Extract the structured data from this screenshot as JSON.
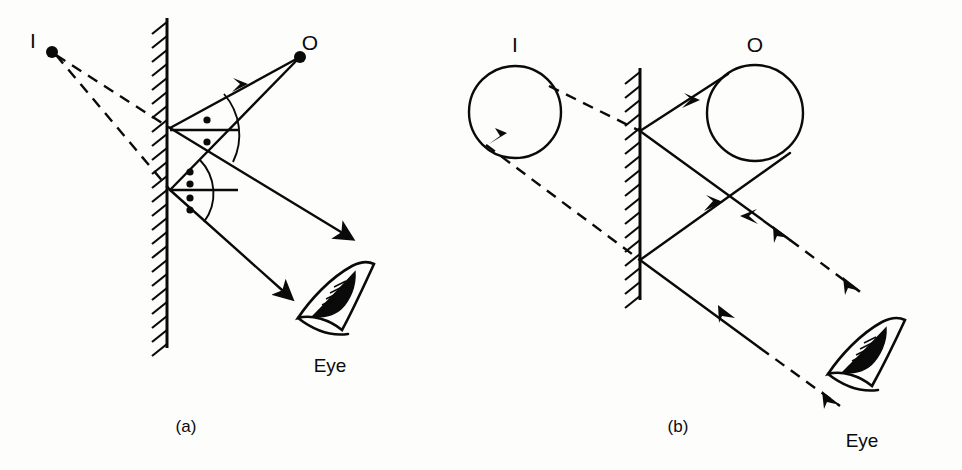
{
  "figure": {
    "background_color": "#fdfdfc",
    "ink_color": "#0a0a0a",
    "width": 962,
    "height": 470
  },
  "panel_a": {
    "caption": "(a)",
    "image_label": "I",
    "object_label": "O",
    "eye_label": "Eye",
    "description": "Point object O in front of a plane mirror; two rays reflect to the eye and the dashed backward extensions meet at the virtual image point I.",
    "mirror_x": 167,
    "mirror_top": 18,
    "mirror_bottom": 348,
    "object_point": [
      300,
      57
    ],
    "image_point": [
      52,
      52
    ],
    "reflection_points": [
      [
        170,
        128
      ],
      [
        170,
        190
      ]
    ],
    "angle_dots_upper": 1,
    "angle_dots_lower": 2,
    "label_positions": {
      "image": [
        33,
        48
      ],
      "object": [
        306,
        50
      ],
      "eye": [
        330,
        372
      ],
      "caption": [
        176,
        432
      ]
    }
  },
  "panel_b": {
    "caption": "(b)",
    "image_label": "I",
    "object_label": "O",
    "eye_label": "Eye",
    "description": "Extended circular object O in front of a plane mirror; reflected rays cross and the dashed extensions outline the virtual image circle I behind the mirror.",
    "mirror_x": 640,
    "mirror_top": 68,
    "mirror_bottom": 300,
    "object_circle": {
      "cx": 755,
      "cy": 113,
      "r": 48
    },
    "image_circle": {
      "cx": 515,
      "cy": 112,
      "r": 46
    },
    "reflection_points": [
      [
        640,
        131
      ],
      [
        640,
        260
      ]
    ],
    "label_positions": {
      "image": [
        511,
        48
      ],
      "object": [
        748,
        48
      ],
      "eye": [
        860,
        447
      ],
      "caption": [
        668,
        432
      ]
    }
  },
  "legend": {
    "solid_ray": "actual light ray",
    "dashed_ray": "virtual ray extension",
    "hatching": "mirror backing"
  }
}
